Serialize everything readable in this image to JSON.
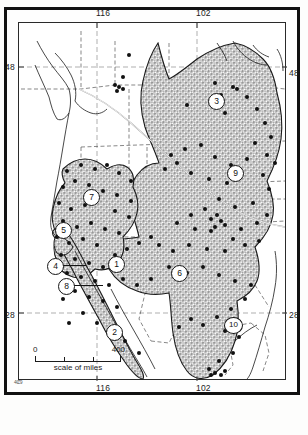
{
  "figure": {
    "kind": "distribution-map",
    "region": "western North America",
    "frame_color": "#111111",
    "land_fill_color": "#b8b8b8",
    "outline_color": "#1a1a1a"
  },
  "graticule": {
    "longitude_labels": [
      "116",
      "102"
    ],
    "latitude_labels": [
      "48",
      "28"
    ],
    "top": [
      {
        "label": "116",
        "x": 96
      },
      {
        "label": "102",
        "x": 196
      }
    ],
    "bottom": [
      {
        "label": "116",
        "x": 96
      },
      {
        "label": "102",
        "x": 196
      }
    ],
    "left": [
      {
        "label": "48",
        "y": 62
      },
      {
        "label": "28",
        "y": 310
      }
    ],
    "right": [
      {
        "label": "48",
        "y": 68
      },
      {
        "label": "28",
        "y": 310
      }
    ],
    "corner_mark": "4Ȼ9"
  },
  "scale": {
    "min_label": "0",
    "max_label": "400",
    "caption": "scale of miles",
    "units": "miles"
  },
  "map_keys": [
    {
      "id": "1",
      "label": "1",
      "x": 108,
      "y": 256,
      "leader": false
    },
    {
      "id": "2",
      "label": "2",
      "x": 106,
      "y": 324,
      "leader": false
    },
    {
      "id": "3",
      "label": "3",
      "x": 208,
      "y": 93,
      "leader": false
    },
    {
      "id": "4",
      "label": "4",
      "x": 47,
      "y": 258,
      "leader": true,
      "leader_width": 22
    },
    {
      "id": "5",
      "label": "5",
      "x": 55,
      "y": 222,
      "leader": false
    },
    {
      "id": "6",
      "label": "6",
      "x": 171,
      "y": 265,
      "leader": false
    },
    {
      "id": "7",
      "label": "7",
      "x": 83,
      "y": 189,
      "leader": false
    },
    {
      "id": "8",
      "label": "8",
      "x": 58,
      "y": 278,
      "leader": true,
      "leader_width": 30
    },
    {
      "id": "9",
      "label": "9",
      "x": 227,
      "y": 165,
      "leader": false
    },
    {
      "id": "10",
      "label": "10",
      "x": 224,
      "y": 317,
      "leader": false
    }
  ]
}
